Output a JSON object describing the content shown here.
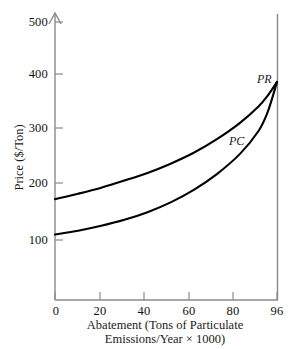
{
  "chart_data": {
    "type": "line",
    "title": "",
    "subtitle": "",
    "xlabel_line1": "Abatement (Tons of Particulate",
    "xlabel_line2": "Emissions/Year × 1000)",
    "ylabel": "Price ($/Ton)",
    "xlim": [
      0,
      96
    ],
    "ylim": [
      0,
      500
    ],
    "grid": false,
    "legend_position": "inline-curve-labels",
    "xticks": [
      0,
      20,
      40,
      60,
      80,
      96
    ],
    "xtick_labels": [
      "0",
      "20",
      "40",
      "60",
      "80",
      "96"
    ],
    "yticks": [
      100,
      200,
      300,
      400,
      500
    ],
    "ytick_labels": [
      "100",
      "200",
      "300",
      "400",
      "500"
    ],
    "axis_color": "#7d7d7d",
    "curve_color": "#000000",
    "series": [
      {
        "name": "PR",
        "label": "PR",
        "label_style": "italic",
        "x": [
          0,
          10,
          20,
          30,
          40,
          50,
          60,
          70,
          80,
          88,
          92,
          96
        ],
        "values": [
          175,
          185,
          196,
          209,
          223,
          240,
          260,
          285,
          315,
          345,
          365,
          390
        ]
      },
      {
        "name": "PC",
        "label": "PC",
        "label_style": "italic",
        "x": [
          0,
          10,
          20,
          30,
          40,
          50,
          60,
          70,
          80,
          88,
          92,
          96
        ],
        "values": [
          110,
          117,
          126,
          137,
          151,
          169,
          192,
          221,
          258,
          300,
          335,
          390
        ]
      }
    ]
  },
  "axes": {
    "y_arrow": "up-arrow-icon",
    "right_boundary": "vertical-rule"
  }
}
